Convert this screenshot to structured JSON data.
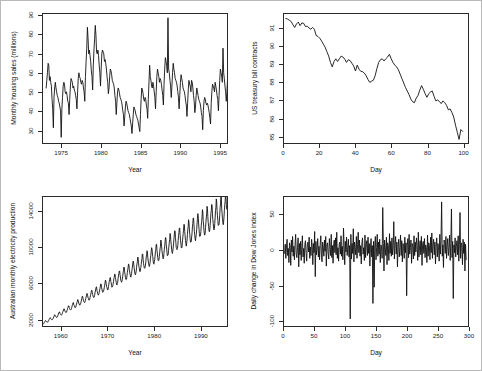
{
  "figure": {
    "layout": "2x2 panel of time series plots",
    "background": "#ffffff",
    "frame_color": "#b9b9b9",
    "line_color": "#111111"
  },
  "chart_data": [
    {
      "type": "line",
      "panel": "top-left",
      "title": "",
      "xlabel": "Year",
      "ylabel": "Monthly housing sales (millions)",
      "xlim": [
        1972.6,
        1996.0
      ],
      "ylim": [
        23,
        91
      ],
      "xticks": [
        1975,
        1980,
        1985,
        1990,
        1995
      ],
      "yticks": [
        30,
        40,
        50,
        60,
        70,
        80,
        90
      ],
      "grid": false,
      "legend": "none",
      "x_start": 1973.0,
      "x_step": 0.0833,
      "values": [
        52,
        56,
        60,
        65,
        64,
        56,
        58,
        55,
        53,
        46,
        41,
        31,
        47,
        52,
        55,
        52,
        50,
        48,
        47,
        45,
        44,
        42,
        40,
        26,
        41,
        47,
        53,
        55,
        54,
        50,
        49,
        50,
        48,
        45,
        44,
        38,
        46,
        53,
        57,
        56,
        55,
        52,
        53,
        51,
        50,
        48,
        46,
        41,
        50,
        57,
        60,
        58,
        57,
        55,
        54,
        56,
        55,
        52,
        50,
        45,
        58,
        66,
        73,
        84,
        78,
        70,
        72,
        69,
        66,
        61,
        58,
        51,
        64,
        72,
        78,
        85,
        80,
        71,
        70,
        72,
        69,
        64,
        60,
        53,
        62,
        70,
        72,
        71,
        70,
        66,
        67,
        65,
        62,
        58,
        55,
        49,
        52,
        58,
        62,
        61,
        59,
        56,
        55,
        54,
        52,
        48,
        45,
        38,
        44,
        50,
        52,
        51,
        49,
        47,
        46,
        45,
        43,
        40,
        38,
        32,
        37,
        42,
        45,
        44,
        42,
        40,
        39,
        38,
        36,
        34,
        32,
        28,
        33,
        38,
        42,
        41,
        40,
        38,
        37,
        36,
        35,
        33,
        31,
        29,
        38,
        46,
        52,
        51,
        49,
        46,
        45,
        47,
        46,
        43,
        41,
        36,
        46,
        55,
        64,
        58,
        56,
        53,
        52,
        55,
        53,
        50,
        47,
        41,
        50,
        58,
        62,
        60,
        58,
        55,
        57,
        56,
        54,
        51,
        48,
        43,
        54,
        62,
        68,
        66,
        64,
        60,
        89,
        62,
        60,
        56,
        53,
        47,
        53,
        60,
        65,
        62,
        60,
        57,
        56,
        55,
        53,
        50,
        47,
        41,
        48,
        55,
        59,
        57,
        55,
        52,
        51,
        50,
        48,
        45,
        43,
        37,
        44,
        51,
        56,
        54,
        53,
        50,
        56,
        55,
        52,
        48,
        45,
        39,
        42,
        48,
        52,
        50,
        48,
        46,
        45,
        44,
        42,
        39,
        37,
        30,
        40,
        45,
        47,
        46,
        44,
        43,
        44,
        43,
        41,
        39,
        36,
        33,
        44,
        50,
        54,
        53,
        52,
        50,
        55,
        53,
        51,
        48,
        46,
        40,
        48,
        56,
        62,
        60,
        58,
        55,
        73,
        60,
        57,
        53,
        50,
        45,
        50,
        57,
        61,
        59,
        57,
        54,
        55,
        57,
        56,
        52,
        49,
        44,
        52,
        58,
        63,
        61,
        59,
        56,
        55,
        54,
        52,
        49,
        46,
        44
      ]
    },
    {
      "type": "line",
      "panel": "top-right",
      "title": "",
      "xlabel": "Day",
      "ylabel": "US treasury bill contracts",
      "xlim": [
        0,
        103
      ],
      "ylim": [
        84.6,
        91.8
      ],
      "xticks": [
        0,
        20,
        40,
        60,
        80,
        100
      ],
      "yticks": [
        85,
        86,
        87,
        88,
        89,
        90,
        91
      ],
      "grid": false,
      "legend": "none",
      "x_start": 1,
      "x_step": 1,
      "values": [
        91.55,
        91.52,
        91.45,
        91.38,
        91.2,
        91.05,
        91.25,
        91.35,
        91.15,
        91.3,
        91.28,
        91.1,
        91.12,
        91.02,
        90.95,
        91.05,
        90.95,
        90.6,
        90.55,
        90.45,
        90.3,
        90.12,
        89.95,
        89.7,
        89.45,
        89.1,
        88.85,
        89.15,
        89.3,
        89.15,
        89.3,
        89.45,
        89.4,
        89.28,
        89.1,
        89.25,
        89.2,
        89.05,
        88.9,
        88.62,
        88.95,
        88.72,
        88.6,
        88.58,
        88.5,
        88.35,
        88.15,
        87.98,
        88.05,
        88.1,
        88.35,
        88.75,
        89.1,
        89.25,
        89.3,
        89.18,
        89.3,
        89.4,
        89.55,
        89.3,
        89.1,
        88.95,
        88.85,
        88.7,
        88.45,
        88.2,
        87.95,
        87.7,
        87.5,
        87.3,
        87.05,
        86.9,
        86.85,
        87.1,
        87.25,
        87.55,
        87.8,
        87.6,
        87.35,
        87.15,
        87.35,
        87.45,
        87.5,
        87.2,
        86.95,
        87.0,
        86.92,
        86.8,
        86.95,
        86.85,
        86.7,
        86.45,
        86.5,
        86.3,
        86.05,
        85.6,
        85.2,
        84.8,
        85.35,
        85.25
      ]
    },
    {
      "type": "line",
      "panel": "bottom-left",
      "title": "",
      "xlabel": "Year",
      "ylabel": "Australian monthly electricity production",
      "xlim": [
        1956.0,
        1995.8
      ],
      "ylim": [
        1200,
        15600
      ],
      "xticks": [
        1960,
        1970,
        1980,
        1990
      ],
      "yticks": [
        2000,
        6000,
        10000,
        14000
      ],
      "grid": false,
      "legend": "none",
      "x_start": 1956.0,
      "x_step": 0.0833,
      "trend_start": 1500,
      "trend_end": 14200,
      "seasonal_amplitude_start": 110,
      "seasonal_amplitude_end": 1350,
      "note": "Monthly data, strong multiplicative annual seasonality with upward trend"
    },
    {
      "type": "line",
      "panel": "bottom-right",
      "title": "",
      "xlabel": "Day",
      "ylabel": "Daily change in Dow Jones index",
      "xlim": [
        0,
        300
      ],
      "ylim": [
        -108,
        75
      ],
      "xticks": [
        0,
        50,
        100,
        150,
        200,
        250,
        300
      ],
      "yticks": [
        -100,
        -50,
        0,
        50
      ],
      "grid": false,
      "legend": "none",
      "x_start": 1,
      "x_step": 1,
      "mean": 0,
      "note": "White noise series of daily changes, approx range -100 to +70",
      "values": [
        -5,
        8,
        -12,
        4,
        15,
        -8,
        2,
        -18,
        10,
        6,
        -22,
        14,
        -3,
        19,
        -9,
        5,
        -14,
        8,
        22,
        -6,
        -11,
        3,
        17,
        -24,
        9,
        -7,
        12,
        -15,
        5,
        20,
        -10,
        2,
        -19,
        8,
        13,
        -5,
        -16,
        7,
        11,
        -3,
        18,
        -12,
        4,
        -8,
        15,
        6,
        -21,
        9,
        -4,
        26,
        -38,
        12,
        -7,
        3,
        16,
        -10,
        5,
        -14,
        8,
        20,
        -6,
        -17,
        11,
        4,
        -9,
        14,
        -2,
        19,
        -23,
        7,
        10,
        -5,
        -13,
        16,
        3,
        -8,
        22,
        -11,
        6,
        -19,
        9,
        14,
        -4,
        17,
        -7,
        25,
        -12,
        3,
        -16,
        8,
        11,
        -6,
        20,
        -9,
        5,
        -14,
        31,
        7,
        -21,
        12,
        -3,
        18,
        -8,
        4,
        15,
        -10,
        6,
        -98,
        22,
        -13,
        9,
        -5,
        30,
        -17,
        11,
        3,
        -7,
        19,
        -12,
        8,
        25,
        -4,
        14,
        -9,
        6,
        -20,
        10,
        17,
        -6,
        3,
        -15,
        21,
        -11,
        7,
        13,
        -8,
        18,
        -5,
        9,
        -23,
        4,
        16,
        -10,
        6,
        -76,
        12,
        -53,
        8,
        19,
        -14,
        3,
        22,
        -9,
        11,
        -6,
        15,
        -18,
        7,
        5,
        -12,
        60,
        9,
        -30,
        14,
        3,
        -8,
        18,
        -21,
        10,
        6,
        -15,
        23,
        -5,
        12,
        -9,
        17,
        -7,
        4,
        40,
        -13,
        8,
        19,
        -6,
        11,
        -24,
        5,
        15,
        -10,
        3,
        21,
        -8,
        13,
        -17,
        9,
        6,
        -12,
        18,
        -4,
        10,
        -65,
        7,
        16,
        -11,
        22,
        -6,
        3,
        14,
        -19,
        9,
        5,
        -13,
        20,
        -8,
        11,
        -3,
        17,
        6,
        -15,
        25,
        -10,
        4,
        13,
        -7,
        19,
        -22,
        8,
        12,
        -5,
        16,
        -11,
        7,
        3,
        -18,
        21,
        -9,
        10,
        6,
        -14,
        18,
        -4,
        24,
        -12,
        8,
        15,
        -7,
        11,
        -20,
        5,
        17,
        -10,
        9,
        3,
        -16,
        22,
        -6,
        13,
        68,
        -9,
        7,
        -25,
        14,
        10,
        -5,
        19,
        -12,
        6,
        16,
        -8,
        3,
        21,
        -15,
        9,
        58,
        -11,
        12,
        -69,
        7,
        -4,
        17,
        -10,
        5,
        13,
        -7,
        20,
        -16,
        8,
        53,
        -12,
        10,
        6,
        -21,
        15,
        -5,
        11,
        -30,
        8,
        -14
      ]
    }
  ]
}
